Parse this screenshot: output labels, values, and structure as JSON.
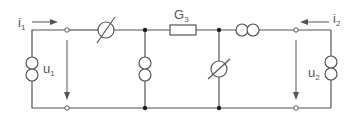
{
  "diagram": {
    "title": "",
    "colors": {
      "line": "#555555",
      "node": "#222222",
      "background": "#ffffff"
    },
    "labels": {
      "i1": {
        "main": "i",
        "sub": "1"
      },
      "i2": {
        "main": "i",
        "sub": "2"
      },
      "u1": {
        "main": "u",
        "sub": "1"
      },
      "u2": {
        "main": "u",
        "sub": "2"
      },
      "g3": {
        "main": "G",
        "sub": "3"
      }
    },
    "components": [
      {
        "id": "source-u1",
        "type": "current-source-double-circle",
        "orientation": "vertical",
        "position": "left-outer"
      },
      {
        "id": "crossed-source-top",
        "type": "crossed-circle",
        "orientation": "horizontal",
        "position": "top-left"
      },
      {
        "id": "source-middle-left",
        "type": "current-source-double-circle",
        "orientation": "vertical",
        "position": "middle-left-shunt"
      },
      {
        "id": "resistor-g3",
        "type": "resistor",
        "label": "G3",
        "orientation": "horizontal",
        "position": "top-center"
      },
      {
        "id": "crossed-source-shunt",
        "type": "crossed-circle",
        "orientation": "vertical",
        "position": "middle-right-shunt"
      },
      {
        "id": "source-top-right",
        "type": "current-source-double-circle",
        "orientation": "horizontal",
        "position": "top-right"
      },
      {
        "id": "source-u2",
        "type": "current-source-double-circle",
        "orientation": "vertical",
        "position": "right-outer"
      }
    ],
    "ports": [
      {
        "id": "port-1",
        "current": "i1",
        "voltage": "u1",
        "current_direction": "right",
        "voltage_direction": "down"
      },
      {
        "id": "port-2",
        "current": "i2",
        "voltage": "u2",
        "current_direction": "left",
        "voltage_direction": "down"
      }
    ]
  }
}
